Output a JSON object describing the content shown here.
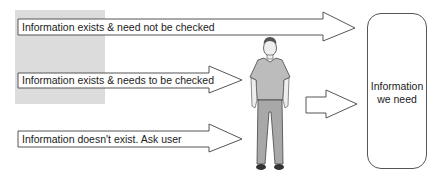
{
  "diagram": {
    "arrows": [
      {
        "label": "Information exists & need not be checked"
      },
      {
        "label": "Information exists & needs to be checked"
      },
      {
        "label": "Information doesn't exist. Ask user"
      }
    ],
    "target": {
      "line1": "Information",
      "line2": "we need"
    },
    "figure": "person-standing"
  }
}
